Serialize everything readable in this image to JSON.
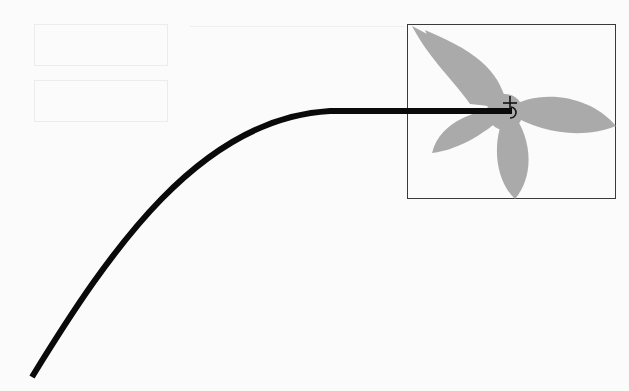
{
  "scene": {
    "background_color": "#fbfbfb",
    "faint_buttons": [
      {
        "x": 34,
        "y": 24,
        "w": 132,
        "h": 40,
        "label": ""
      },
      {
        "x": 34,
        "y": 80,
        "w": 132,
        "h": 40,
        "label": ""
      }
    ],
    "preview_frame": {
      "x": 407,
      "y": 24,
      "w": 209,
      "h": 175,
      "border_color": "#3a3a3a"
    },
    "shape": {
      "name": "four-petal-flower",
      "fill": "#aaaaaa"
    },
    "drag_path": {
      "stroke": "#0a0a0a",
      "stroke_width": 6,
      "start": [
        32,
        377
      ],
      "end": [
        512,
        111
      ],
      "d": "M 32 377 C 110 250, 200 118, 330 111 L 512 111"
    },
    "cursor": {
      "type": "move-crosshair-with-rotate",
      "x": 510,
      "y": 104
    }
  }
}
